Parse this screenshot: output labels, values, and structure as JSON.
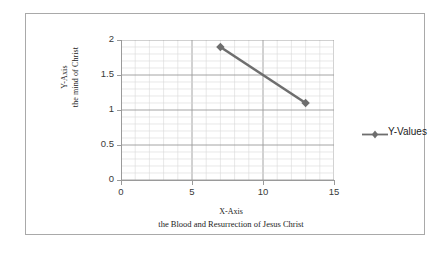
{
  "chart_data": {
    "type": "line",
    "title": "",
    "xlabel": "X-Axis",
    "xlabel_sub": "the Blood  and Resurrection of Jesus Christ",
    "ylabel": "Y-Axis",
    "ylabel_sub": "the mind of Christ",
    "xlim": [
      0,
      15
    ],
    "ylim": [
      0,
      2
    ],
    "x_ticks": [
      0,
      5,
      10,
      15
    ],
    "x_tick_labels": [
      "0",
      "5",
      "10",
      "15"
    ],
    "y_ticks": [
      0,
      0.5,
      1,
      1.5,
      2
    ],
    "y_tick_labels": [
      "0",
      "0.5",
      "1",
      "1.5",
      "2"
    ],
    "grid": true,
    "grid_minor_x_step": 1,
    "grid_minor_y_step": 0.1,
    "legend_position": "right",
    "series": [
      {
        "name": "Y-Values",
        "marker": "diamond",
        "color": "#6e6e6e",
        "x": [
          7,
          13
        ],
        "values": [
          1.9,
          1.1
        ],
        "points": [
          {
            "x": 7,
            "y": 1.9
          },
          {
            "x": 13,
            "y": 1.1
          }
        ]
      }
    ]
  },
  "legend": {
    "entries": [
      {
        "label": "Y-Values",
        "color": "#6e6e6e",
        "marker": "diamond"
      }
    ]
  },
  "colors": {
    "series": "#6e6e6e",
    "axis": "#9a9a9a",
    "major_grid": "#9a9a9a",
    "minor_grid": "#d8d8d8",
    "frame": "#a9a9a9",
    "text": "#1c1c1c",
    "tick_text": "#3a3a3a",
    "background": "#ffffff"
  }
}
